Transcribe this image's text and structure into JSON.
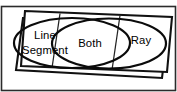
{
  "diagram": {
    "type": "venn",
    "regions": [
      {
        "id": "left",
        "label": "Line Segment",
        "line1": "Line",
        "line2": "Segment"
      },
      {
        "id": "center",
        "label": "Both",
        "line1": "Both",
        "line2": ""
      },
      {
        "id": "right",
        "label": "Ray",
        "line1": "Ray",
        "line2": ""
      }
    ],
    "colors": {
      "stroke": "#0b0b0b",
      "frame_stroke": "#111111",
      "border_stroke": "#2b2b2b",
      "background": "#ffffff",
      "text": "#000000"
    },
    "frame": {
      "style": "stacked-tilted-sheets",
      "sheet_count": 2
    },
    "dividers": 2
  }
}
